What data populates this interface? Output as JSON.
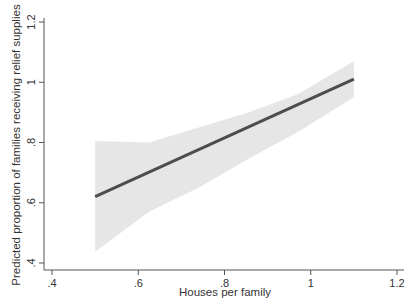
{
  "chart_data": {
    "type": "line",
    "title": "",
    "xlabel": "Houses per family",
    "ylabel": "Predicted proportion of families receiving relief supplies",
    "xlim": [
      0.4,
      1.2
    ],
    "ylim": [
      0.4,
      1.2
    ],
    "xticks": [
      0.4,
      0.6,
      0.8,
      1.0,
      1.2
    ],
    "xtick_labels": [
      ".4",
      ".6",
      ".8",
      "1",
      "1.2"
    ],
    "yticks": [
      0.4,
      0.6,
      0.8,
      1.0,
      1.2
    ],
    "ytick_labels": [
      ".4",
      ".6",
      ".8",
      "1",
      "1.2"
    ],
    "grid": false,
    "legend": null,
    "series": [
      {
        "name": "Predicted proportion",
        "x": [
          0.5,
          1.1
        ],
        "y": [
          0.62,
          1.01
        ],
        "color": "#4d4d4d"
      },
      {
        "name": "95% confidence interval",
        "type": "area",
        "x": [
          0.5,
          0.625,
          0.74,
          0.855,
          0.97,
          1.1
        ],
        "upper": [
          0.805,
          0.8,
          0.85,
          0.9,
          0.96,
          1.07
        ],
        "lower": [
          0.437,
          0.57,
          0.65,
          0.745,
          0.835,
          0.95
        ],
        "color": "#e6e6e6"
      }
    ]
  },
  "colors": {
    "line": "#4d4d4d",
    "band": "#e6e6e6",
    "axis": "#555555"
  }
}
